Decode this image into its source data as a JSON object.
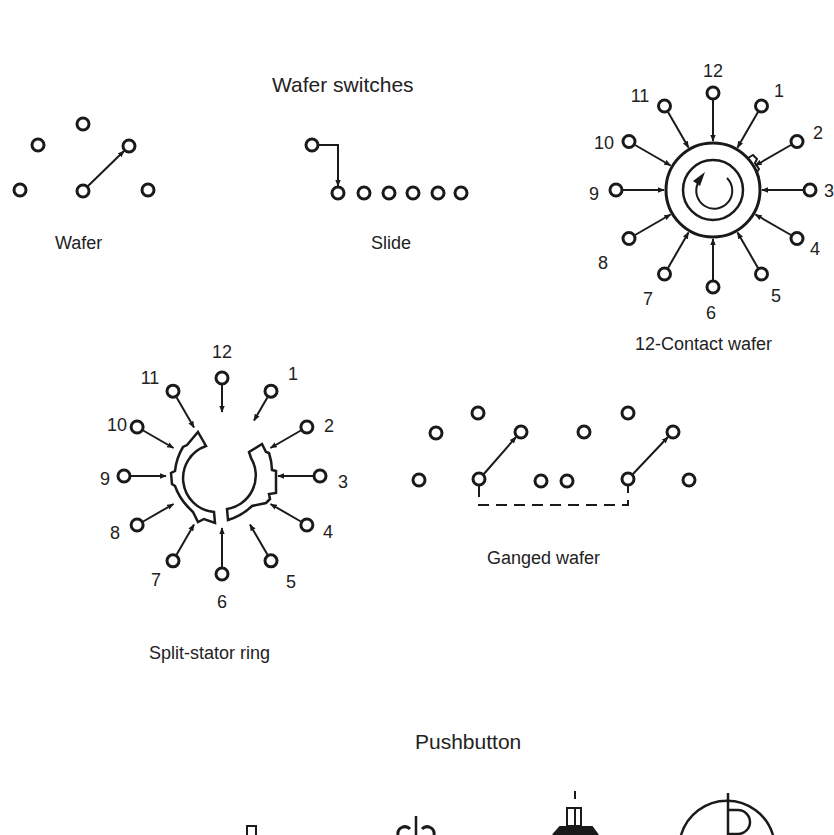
{
  "sections": {
    "wafer_switches": {
      "title": "Wafer switches",
      "diagrams": {
        "wafer": {
          "caption": "Wafer"
        },
        "slide": {
          "caption": "Slide"
        },
        "contact12": {
          "caption": "12-Contact wafer",
          "contact_labels": [
            "12",
            "1",
            "2",
            "3",
            "4",
            "5",
            "6",
            "7",
            "8",
            "9",
            "10",
            "11"
          ]
        },
        "split_stator": {
          "caption": "Split-stator ring",
          "contact_labels": [
            "12",
            "1",
            "2",
            "3",
            "4",
            "5",
            "6",
            "7",
            "8",
            "9",
            "10",
            "11"
          ]
        },
        "ganged": {
          "caption": "Ganged wafer"
        }
      }
    },
    "pushbutton": {
      "title": "Pushbutton"
    }
  },
  "colors": {
    "ink": "#1a1a1a",
    "background": "#ffffff"
  }
}
